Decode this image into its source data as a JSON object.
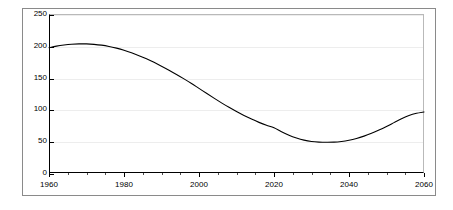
{
  "chart_data": {
    "type": "line",
    "title": "",
    "subtitle": "",
    "xlabel": "",
    "ylabel": "",
    "xlim": [
      1960,
      2060
    ],
    "ylim": [
      0,
      250
    ],
    "grid": true,
    "legend": false,
    "legend_position": "none",
    "x_ticks": [
      1960,
      1980,
      2000,
      2020,
      2040,
      2060
    ],
    "x_tick_labels": [
      "1960",
      "1980",
      "2000",
      "2020",
      "2040",
      "2060"
    ],
    "x_minor_tick_step": 5,
    "y_ticks": [
      0,
      50,
      100,
      150,
      200,
      250
    ],
    "y_tick_labels": [
      "0",
      "50",
      "100",
      "150",
      "200",
      "250"
    ],
    "line_color": "#000000",
    "line_width": 1,
    "series": [
      {
        "name": "series-1",
        "x": [
          1960,
          1962,
          1964,
          1966,
          1968,
          1970,
          1972,
          1974,
          1976,
          1978,
          1980,
          1982,
          1984,
          1986,
          1988,
          1990,
          1992,
          1994,
          1996,
          1998,
          2000,
          2002,
          2004,
          2006,
          2008,
          2010,
          2012,
          2014,
          2016,
          2018,
          2020,
          2022,
          2024,
          2026,
          2028,
          2030,
          2032,
          2034,
          2036,
          2038,
          2040,
          2042,
          2044,
          2046,
          2048,
          2050,
          2052,
          2054,
          2056,
          2058,
          2060
        ],
        "values": [
          197,
          199.5,
          201.3,
          202.5,
          203,
          203,
          202.3,
          201,
          199,
          196.3,
          193,
          189,
          184.5,
          179.5,
          174,
          168,
          161.7,
          155,
          148,
          140.7,
          133,
          125.3,
          117.7,
          110.3,
          103.3,
          96.7,
          90.5,
          84.8,
          79.6,
          75,
          71,
          64.8,
          59.3,
          55,
          51.7,
          49.6,
          48.6,
          48.3,
          48.5,
          49.6,
          51.5,
          54.3,
          58,
          62.5,
          67.6,
          73.2,
          79.2,
          85.2,
          90.3,
          93.8,
          96
        ]
      }
    ]
  },
  "axes": {
    "y_labels": [
      {
        "value": 250,
        "text": "250"
      },
      {
        "value": 200,
        "text": "200"
      },
      {
        "value": 150,
        "text": "150"
      },
      {
        "value": 100,
        "text": "100"
      },
      {
        "value": 50,
        "text": "50"
      },
      {
        "value": 0,
        "text": "0"
      }
    ],
    "x_labels": [
      {
        "value": 1960,
        "text": "1960"
      },
      {
        "value": 1980,
        "text": "1980"
      },
      {
        "value": 2000,
        "text": "2000"
      },
      {
        "value": 2020,
        "text": "2020"
      },
      {
        "value": 2040,
        "text": "2040"
      },
      {
        "value": 2060,
        "text": "2060"
      }
    ]
  },
  "colors": {
    "background": "#ffffff",
    "frame": "#8a8a8a",
    "axis": "#000000",
    "grid": "#ededed",
    "line": "#000000",
    "text": "#000000"
  }
}
